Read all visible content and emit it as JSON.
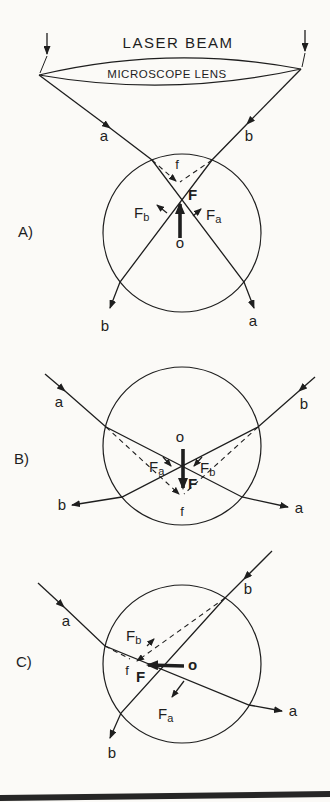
{
  "colors": {
    "ink": "#1e1e1e",
    "paper": "#fbfaf7",
    "scan_bar": "#262626"
  },
  "header": {
    "laser_beam": "LASER BEAM",
    "microscope_lens": "MICROSCOPE LENS"
  },
  "panels": {
    "a": {
      "label": "A)",
      "ray_a_top": "a",
      "ray_b_top": "b",
      "ray_b_bottom": "b",
      "ray_a_bottom": "a",
      "focus": "f",
      "origin": "o",
      "net_force": "F",
      "force_b_main": "F",
      "force_b_sub": "b",
      "force_a_main": "F",
      "force_a_sub": "a"
    },
    "b": {
      "label": "B)",
      "ray_a_top": "a",
      "ray_b_top": "b",
      "ray_b_out": "b",
      "ray_a_out": "a",
      "focus": "f",
      "origin": "o",
      "net_force": "F",
      "force_a_main": "F",
      "force_a_sub": "a",
      "force_b_main": "F",
      "force_b_sub": "b"
    },
    "c": {
      "label": "C)",
      "ray_a_in": "a",
      "ray_b_in": "b",
      "ray_a_out": "a",
      "ray_b_out": "b",
      "focus": "f",
      "origin": "o",
      "net_force": "F",
      "force_b_main": "F",
      "force_b_sub": "b",
      "force_a_main": "F",
      "force_a_sub": "a"
    }
  }
}
